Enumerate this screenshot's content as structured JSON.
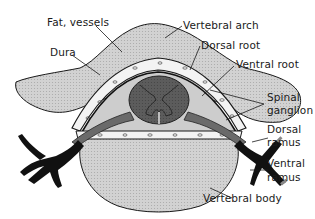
{
  "figure": {
    "labels": {
      "fat_vessels": "Fat, vessels",
      "dura": "Dura",
      "vertebral_arch": "Vertebral arch",
      "dorsal_root": "Dorsal root",
      "ventral_root": "Ventral root",
      "spinal_ganglion_1": "Spinal",
      "spinal_ganglion_2": "ganglion",
      "dorsal_ramus_1": "Dorsal",
      "dorsal_ramus_2": "ramus",
      "ventral_ramus_1": "Ventral",
      "ventral_ramus_2": "ramus",
      "vertebral_body": "Vertebral body"
    },
    "colors": {
      "bone_fill": "#cfcfcf",
      "cord_fill": "#5a5a5a",
      "nerve_fill": "#111111",
      "fat_fill": "#f2f2f2",
      "outline": "#1a1a1a"
    }
  }
}
